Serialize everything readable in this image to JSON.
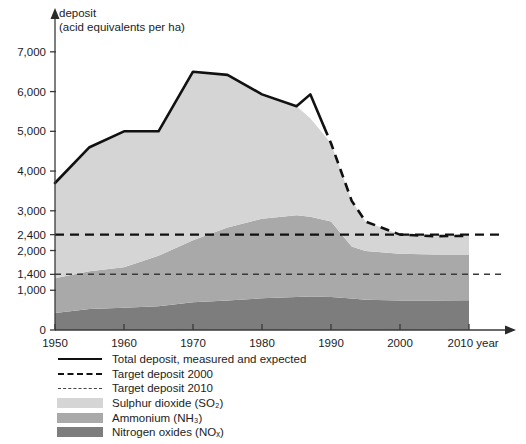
{
  "chart_data": {
    "type": "area",
    "title": "deposit",
    "subtitle": "(acid equivalents per ha)",
    "ylabel": "deposit (acid equivalents per ha)",
    "xlabel": "year",
    "x_unit_label": "year",
    "grid": false,
    "legend_position": "bottom-left",
    "stacked": true,
    "xlim": [
      1950,
      2010
    ],
    "ylim": [
      0,
      7600
    ],
    "xticks": [
      1950,
      1960,
      1970,
      1980,
      1990,
      2000,
      2010
    ],
    "xtick_labels": [
      "1950",
      "1960",
      "1970",
      "1980",
      "1990",
      "2000",
      "2010"
    ],
    "yticks": [
      0,
      1000,
      1400,
      2000,
      2400,
      3000,
      4000,
      5000,
      6000,
      7000
    ],
    "ytick_labels": [
      "0",
      "1,000",
      "1,400",
      "2,000",
      "2,400",
      "3,000",
      "4,000",
      "5,000",
      "6,000",
      "7,000"
    ],
    "measured_until": 1989,
    "x": [
      1950,
      1955,
      1960,
      1965,
      1970,
      1975,
      1980,
      1985,
      1987,
      1990,
      1993,
      1995,
      2000,
      2005,
      2010
    ],
    "series": [
      {
        "name": "Nitrogen oxides (NOx)",
        "color": "#7d7d7d",
        "values": [
          430,
          530,
          560,
          600,
          700,
          740,
          800,
          830,
          840,
          830,
          790,
          760,
          740,
          740,
          750
        ]
      },
      {
        "name": "Ammonium (NH3)",
        "color": "#a9a9a9",
        "values": [
          870,
          950,
          1020,
          1270,
          1560,
          1840,
          2000,
          2060,
          2010,
          1900,
          1310,
          1230,
          1180,
          1160,
          1150
        ]
      },
      {
        "name": "Sulphur dioxide (SO2)",
        "color": "#d5d5d5",
        "values": [
          2400,
          3120,
          3420,
          3130,
          4240,
          3840,
          3130,
          2740,
          2480,
          1970,
          1150,
          740,
          480,
          460,
          470
        ]
      }
    ],
    "total_deposit": {
      "name": "Total deposit, measured and expected",
      "color": "#111111",
      "values": [
        3700,
        4600,
        5000,
        5000,
        6500,
        6420,
        5930,
        5630,
        5930,
        4700,
        3250,
        2730,
        2400,
        2360,
        2370
      ]
    },
    "reference_lines": [
      {
        "name": "Target deposit 2000",
        "value": 2400,
        "style": "dashed-coarse",
        "color": "#111111"
      },
      {
        "name": "Target deposit 2010",
        "value": 1400,
        "style": "dashed-fine",
        "color": "#3a3a3a"
      }
    ]
  },
  "axis": {
    "title_line1": "deposit",
    "title_line2": "(acid equivalents per ha)",
    "x_unit": "year"
  },
  "legend": {
    "items": [
      {
        "label": "Total deposit, measured and expected",
        "key": "solid-line",
        "color": "#111111"
      },
      {
        "label": "Target deposit 2000",
        "key": "dashed-coarse-line",
        "color": "#111111"
      },
      {
        "label": "Target deposit 2010",
        "key": "dashed-fine-line",
        "color": "#3a3a3a"
      },
      {
        "label": "Sulphur dioxide (SO₂)",
        "key": "swatch",
        "color": "#d5d5d5"
      },
      {
        "label": "Ammonium (NH₃)",
        "key": "swatch",
        "color": "#a9a9a9"
      },
      {
        "label": "Nitrogen oxides (NOₓ)",
        "key": "swatch",
        "color": "#7d7d7d"
      }
    ]
  }
}
